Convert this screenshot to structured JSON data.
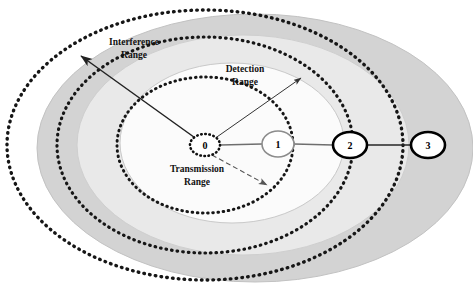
{
  "figure": {
    "type": "wireless-range-diagram"
  },
  "labels": {
    "interference": {
      "line1": "Interference",
      "line2": "Range"
    },
    "detection": {
      "line1": "Detection",
      "line2": "Range"
    },
    "transmission": {
      "line1": "Transmission",
      "line2": "Range"
    }
  },
  "nodes": [
    {
      "id": "0",
      "label": "0",
      "cx": 205,
      "cy": 145,
      "rx": 15,
      "ry": 11,
      "style": "dotted"
    },
    {
      "id": "1",
      "label": "1",
      "cx": 278,
      "cy": 144,
      "rx": 16,
      "ry": 13,
      "style": "gray"
    },
    {
      "id": "2",
      "label": "2",
      "cx": 350,
      "cy": 145,
      "rx": 17,
      "ry": 13,
      "style": "bold"
    },
    {
      "id": "3",
      "label": "3",
      "cx": 428,
      "cy": 145,
      "rx": 17,
      "ry": 13,
      "style": "bold"
    }
  ],
  "links": [
    {
      "from": "0",
      "to": "1"
    },
    {
      "from": "1",
      "to": "2"
    },
    {
      "from": "2",
      "to": "3"
    }
  ],
  "ranges": [
    {
      "name": "transmission",
      "cx": 205,
      "cy": 145,
      "rx": 88,
      "ry": 68,
      "stroke": "dotted"
    },
    {
      "name": "detection",
      "cx": 205,
      "cy": 145,
      "rx": 148,
      "ry": 108,
      "stroke": "dotted"
    },
    {
      "name": "interference",
      "cx": 205,
      "cy": 145,
      "rx": 198,
      "ry": 135,
      "stroke": "dotted"
    }
  ],
  "shaded_regions": [
    {
      "name": "outer-gray-ellipse",
      "cx": 255,
      "cy": 148,
      "rx": 218,
      "ry": 135,
      "fill": "#d2d2d2"
    },
    {
      "name": "middle-gray-ellipse",
      "cx": 243,
      "cy": 145,
      "rx": 165,
      "ry": 110,
      "fill": "#e8e8e8"
    },
    {
      "name": "inner-white-ellipse",
      "cx": 232,
      "cy": 143,
      "rx": 112,
      "ry": 80,
      "fill": "#fafafa"
    }
  ],
  "arrows": [
    {
      "name": "interference-arrow",
      "x1": 205,
      "y1": 145,
      "x2": 79,
      "y2": 55,
      "style": "solid",
      "head": "end"
    },
    {
      "name": "detection-arrow",
      "x1": 214,
      "y1": 138,
      "x2": 302,
      "y2": 77,
      "style": "solid-thin",
      "head": "end"
    },
    {
      "name": "transmission-arrow",
      "x1": 211,
      "y1": 155,
      "x2": 268,
      "y2": 186,
      "style": "dashed",
      "head": "end"
    }
  ],
  "colors": {
    "outer_shade": "#d2d2d2",
    "middle_shade": "#e8e8e8",
    "inner_shade": "#fafafa",
    "dotted_stroke": "#161616",
    "node_gray": "#8c8c8c",
    "node_black": "#000000",
    "link_gray": "#6e6e6e",
    "background": "#ffffff"
  }
}
